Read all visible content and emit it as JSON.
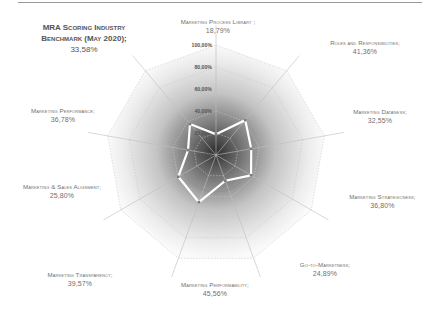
{
  "chart_data": {
    "type": "radar",
    "title": "",
    "benchmark": {
      "label": "MRA Scoring Industry Benchmark (May 2020);",
      "value": 33.58,
      "value_label": "33,58%"
    },
    "categories": [
      "Marketing Process Library",
      "Roles and Responsibilities",
      "Marketing Dataness",
      "Marketing Strategicness",
      "Go-to-Marketness",
      "Marketing Performability",
      "Marketing Transparency",
      "Marketing & Sales Alignment",
      "Marketing Performance"
    ],
    "series": [
      {
        "name": "Score",
        "values": [
          18.79,
          41.36,
          32.55,
          36.8,
          24.89,
          45.56,
          39.57,
          25.8,
          36.78
        ]
      }
    ],
    "value_labels": [
      "18,79%",
      "41,36%",
      "32,55%",
      "36,80%",
      "24,89%",
      "45,56%",
      "39,57%",
      "25,80%",
      "36,78%"
    ],
    "radial_ticks": [
      "100,00%",
      "80,00%",
      "60,00%",
      "40,00%",
      "20,00%",
      "0,00%"
    ],
    "rlim": [
      0,
      100
    ],
    "grid": true,
    "legend": "none"
  },
  "labels": {
    "benchmark_title": "MRA Scoring Industry Benchmark (May 2020);",
    "benchmark_value": "33,58%",
    "cat0": "Marketing Process Library ;",
    "val0": "18,79%",
    "cat1": "Roles and Responsibilities;",
    "val1": "41,36%",
    "cat2": "Marketing Dataness;",
    "val2": "32,55%",
    "cat3": "Marketing Strategicness;",
    "val3": "36,80%",
    "cat4": "Go-to-Marketness;",
    "val4": "24,89%",
    "cat5": "Marketing Performability;",
    "val5": "45,56%",
    "cat6": "Marketing Transparency;",
    "val6": "39,57%",
    "cat7": "Marketing & Sales Alignment;",
    "val7": "25,80%",
    "cat8": "Marketing Performance;",
    "val8": "36,78%"
  },
  "colors": {
    "series_line": "#ffffff",
    "marker": "#7a7a7a",
    "grid": "#c8c8c8",
    "center_dark": "#3a3a3a"
  }
}
